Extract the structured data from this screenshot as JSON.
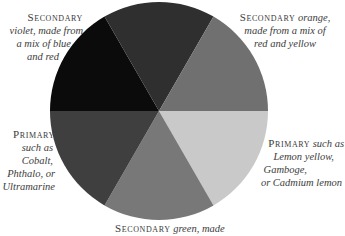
{
  "diagram": {
    "type": "color-wheel",
    "center": [
      159,
      111
    ],
    "radius": 109,
    "wedges": [
      {
        "name": "violet",
        "start_deg": 180,
        "end_deg": 240,
        "fill": "#0b0b0b"
      },
      {
        "name": "red",
        "start_deg": 240,
        "end_deg": 300,
        "fill": "#2f2f2f"
      },
      {
        "name": "orange",
        "start_deg": 300,
        "end_deg": 360,
        "fill": "#707070"
      },
      {
        "name": "yellow",
        "start_deg": 0,
        "end_deg": 60,
        "fill": "#c9c9c9"
      },
      {
        "name": "green",
        "start_deg": 60,
        "end_deg": 120,
        "fill": "#787878"
      },
      {
        "name": "blue",
        "start_deg": 120,
        "end_deg": 180,
        "fill": "#3f3f3f"
      }
    ]
  },
  "labels": {
    "violet": {
      "kind": "Secondary",
      "lines": [
        "violet, made from",
        "a mix of blue",
        "and red"
      ]
    },
    "orange": {
      "kind": "Secondary",
      "first_suffix": " orange,",
      "lines": [
        "made from a mix of",
        "red and yellow"
      ]
    },
    "blue": {
      "kind": "Primary",
      "lines": [
        "such as",
        "Cobalt,",
        "Phthalo, or",
        "Ultramarine"
      ]
    },
    "yellow": {
      "kind": "Primary",
      "first_suffix": " such as",
      "lines": [
        "Lemon yellow,",
        "Gamboge,",
        "or Cadmium lemon"
      ]
    },
    "green": {
      "kind": "Secondary",
      "first_suffix": " green, made"
    }
  }
}
